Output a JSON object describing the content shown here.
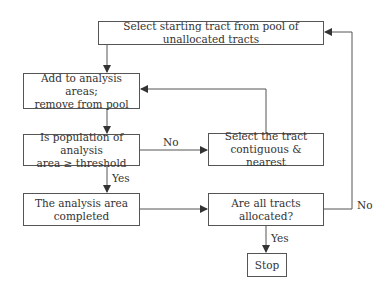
{
  "diagram": {
    "type": "flowchart",
    "nodes": {
      "start": "Select starting tract from pool of unallocated tracts",
      "add_line1": "Add to analysis areas;",
      "add_line2": "remove from pool",
      "check_line1": "Is population of analysis",
      "check_line2": "area ≥ threshold",
      "select_line1": "Select the tract",
      "select_line2": "contiguous & nearest",
      "completed_line1": "The analysis area",
      "completed_line2": "completed",
      "allocated": "Are all tracts allocated?",
      "stop": "Stop"
    },
    "edge_labels": {
      "check_no": "No",
      "check_yes": "Yes",
      "allocated_yes": "Yes",
      "allocated_no": "No"
    },
    "colors": {
      "line": "#555555",
      "text": "#333333",
      "background": "#ffffff"
    }
  }
}
